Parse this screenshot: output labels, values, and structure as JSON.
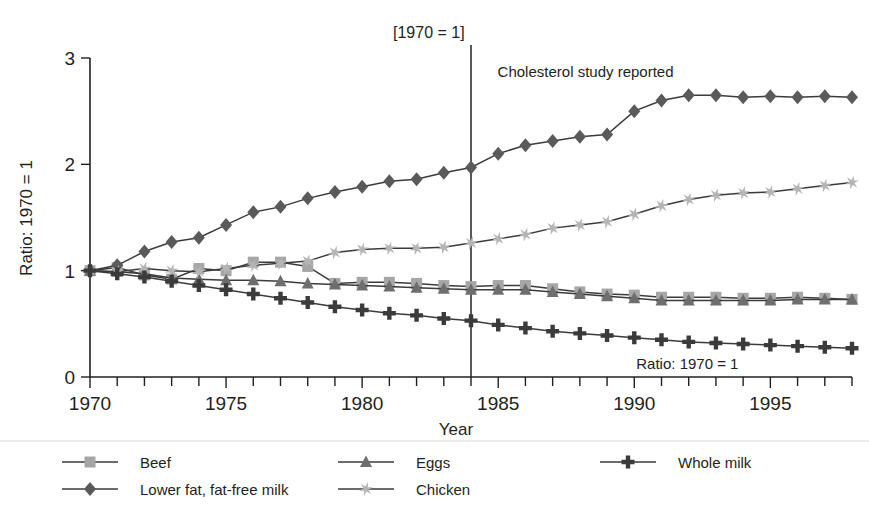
{
  "figure": {
    "bracket_note": "[1970 = 1]",
    "event_annotation": "Cholesterol study reported",
    "inplot_note": "Ratio: 1970 = 1",
    "event_year": 1984
  },
  "axes": {
    "y_title": "Ratio: 1970 = 1",
    "x_title": "Year",
    "y_ticklabels": [
      "3",
      "2",
      "1",
      "0"
    ],
    "x_ticklabels": [
      "1970",
      "1975",
      "1980",
      "1985",
      "1990",
      "1995"
    ]
  },
  "legend": {
    "entries": [
      {
        "label": "Beef",
        "icon": "square-marker-icon",
        "color": "#a6a6a6"
      },
      {
        "label": "Lower fat, fat-free milk",
        "icon": "diamond-marker-icon",
        "color": "#5a5a5a"
      },
      {
        "label": "Eggs",
        "icon": "triangle-marker-icon",
        "color": "#6e6e6e"
      },
      {
        "label": "Chicken",
        "icon": "star-marker-icon",
        "color": "#b5b5b5"
      },
      {
        "label": "Whole milk",
        "icon": "plus-marker-icon",
        "color": "#3b3b3b"
      }
    ]
  },
  "chart_data": {
    "type": "line",
    "title": "",
    "subtitle": "",
    "xlabel": "Year",
    "ylabel": "Ratio: 1970 = 1",
    "xlim": [
      1970,
      1998
    ],
    "ylim": [
      0,
      3
    ],
    "yticks": [
      0,
      1,
      2,
      3
    ],
    "xticks": [
      1970,
      1975,
      1980,
      1985,
      1990,
      1995
    ],
    "grid": false,
    "legend_position": "below-plot",
    "annotations": [
      {
        "text": "[1970 = 1]",
        "x": 1984,
        "y": 3.15
      },
      {
        "text": "Cholesterol study reported",
        "x": 1984.5,
        "y": 2.85
      },
      {
        "text": "Ratio: 1970 = 1",
        "x": 1990,
        "y": 0.18
      }
    ],
    "vertical_lines": [
      {
        "x": 1984,
        "label": "Cholesterol study reported"
      }
    ],
    "x": [
      1970,
      1971,
      1972,
      1973,
      1974,
      1975,
      1976,
      1977,
      1978,
      1979,
      1980,
      1981,
      1982,
      1983,
      1984,
      1985,
      1986,
      1987,
      1988,
      1989,
      1990,
      1991,
      1992,
      1993,
      1994,
      1995,
      1996,
      1997,
      1998
    ],
    "series": [
      {
        "name": "Beef",
        "marker": "square",
        "color": "#a6a6a6",
        "values": [
          1.0,
          1.03,
          0.96,
          0.92,
          1.02,
          1.0,
          1.08,
          1.08,
          1.04,
          0.88,
          0.89,
          0.89,
          0.88,
          0.86,
          0.85,
          0.86,
          0.86,
          0.83,
          0.8,
          0.78,
          0.77,
          0.75,
          0.75,
          0.75,
          0.74,
          0.74,
          0.75,
          0.74,
          0.73
        ]
      },
      {
        "name": "Lower fat, fat-free milk",
        "marker": "diamond",
        "color": "#5a5a5a",
        "values": [
          1.0,
          1.05,
          1.18,
          1.27,
          1.31,
          1.43,
          1.55,
          1.6,
          1.68,
          1.74,
          1.79,
          1.84,
          1.86,
          1.92,
          1.97,
          2.1,
          2.18,
          2.22,
          2.26,
          2.28,
          2.5,
          2.6,
          2.65,
          2.65,
          2.63,
          2.64,
          2.63,
          2.64,
          2.63
        ]
      },
      {
        "name": "Eggs",
        "marker": "triangle",
        "color": "#6e6e6e",
        "values": [
          1.0,
          0.99,
          0.97,
          0.93,
          0.92,
          0.91,
          0.91,
          0.9,
          0.88,
          0.87,
          0.86,
          0.85,
          0.84,
          0.83,
          0.82,
          0.82,
          0.82,
          0.8,
          0.78,
          0.76,
          0.74,
          0.72,
          0.72,
          0.72,
          0.72,
          0.72,
          0.73,
          0.73,
          0.73
        ]
      },
      {
        "name": "Chicken",
        "marker": "star",
        "color": "#b5b5b5",
        "values": [
          1.0,
          0.99,
          1.02,
          1.0,
          0.99,
          1.02,
          1.05,
          1.07,
          1.09,
          1.17,
          1.2,
          1.21,
          1.21,
          1.22,
          1.26,
          1.3,
          1.34,
          1.4,
          1.43,
          1.46,
          1.53,
          1.61,
          1.67,
          1.71,
          1.73,
          1.74,
          1.77,
          1.8,
          1.83
        ]
      },
      {
        "name": "Whole milk",
        "marker": "plus",
        "color": "#3b3b3b",
        "values": [
          1.0,
          0.97,
          0.94,
          0.9,
          0.86,
          0.82,
          0.78,
          0.74,
          0.7,
          0.66,
          0.63,
          0.6,
          0.58,
          0.55,
          0.53,
          0.49,
          0.46,
          0.43,
          0.41,
          0.39,
          0.37,
          0.35,
          0.33,
          0.32,
          0.31,
          0.3,
          0.29,
          0.28,
          0.27
        ]
      }
    ]
  }
}
